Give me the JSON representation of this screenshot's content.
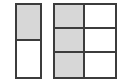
{
  "page": {
    "background_color": "#ffffff",
    "width": 131,
    "height": 82
  },
  "style": {
    "border_color": "#3c3c3c",
    "shaded_color": "#d7d7d7",
    "unshaded_color": "#ffffff",
    "border_width_px": 2
  },
  "figures": [
    {
      "id": "model-half",
      "name": "left-fraction-model",
      "shape": "rectangle",
      "columns": 1,
      "rows": 2,
      "total_parts": 2,
      "shaded_parts": 1,
      "fraction_label": "1/2",
      "cells": [
        {
          "index": 0,
          "row": 0,
          "column": 0,
          "state": "shaded"
        },
        {
          "index": 1,
          "row": 1,
          "column": 0,
          "state": "unshaded"
        }
      ]
    },
    {
      "id": "model-sixths",
      "name": "right-fraction-model",
      "shape": "square",
      "columns": 2,
      "rows": 3,
      "total_parts": 6,
      "shaded_parts": 3,
      "fraction_label": "3/6",
      "cells": [
        {
          "index": 0,
          "row": 0,
          "column": 0,
          "state": "shaded"
        },
        {
          "index": 1,
          "row": 0,
          "column": 1,
          "state": "unshaded"
        },
        {
          "index": 2,
          "row": 1,
          "column": 0,
          "state": "shaded"
        },
        {
          "index": 3,
          "row": 1,
          "column": 1,
          "state": "unshaded"
        },
        {
          "index": 4,
          "row": 2,
          "column": 0,
          "state": "shaded"
        },
        {
          "index": 5,
          "row": 2,
          "column": 1,
          "state": "unshaded"
        }
      ]
    }
  ]
}
